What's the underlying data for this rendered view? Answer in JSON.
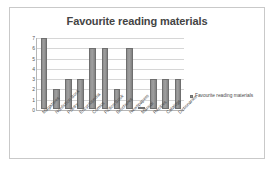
{
  "chart_data": {
    "type": "bar",
    "title": "Favourite reading materials",
    "xlabel": "",
    "ylabel": "",
    "ylim": [
      0,
      7
    ],
    "yticks": [
      0,
      1,
      2,
      3,
      4,
      5,
      6,
      7
    ],
    "grid": true,
    "legend_position": "right",
    "legend": [
      "Favourite reading materials"
    ],
    "categories": [
      "Magazines",
      "Nonfiction Book",
      "Poetry",
      "Encyclopedia",
      "Comics",
      "Fiction Book",
      "Brochures",
      "Newspapers",
      "Manual",
      "Recipes",
      "Catalogs",
      "Dictionaries"
    ],
    "values": [
      7,
      2,
      3,
      3,
      6,
      6,
      2,
      6,
      0,
      3,
      3,
      3
    ],
    "series": [
      {
        "name": "Favourite reading materials",
        "values": [
          7,
          2,
          3,
          3,
          6,
          6,
          2,
          6,
          0,
          3,
          3,
          3
        ],
        "color": "#8d8d8d"
      }
    ]
  },
  "legend": {
    "marker": "legend-square-marker",
    "label": "Favourite reading materials"
  },
  "colors": {
    "bar": "#8d8d8d",
    "bar_border": "#6f6f6f",
    "grid": "#d6d6d6",
    "axis": "#b6b6b6",
    "frame": "#c9c9c9",
    "text": "#4a4a4a",
    "background": "#ffffff"
  }
}
